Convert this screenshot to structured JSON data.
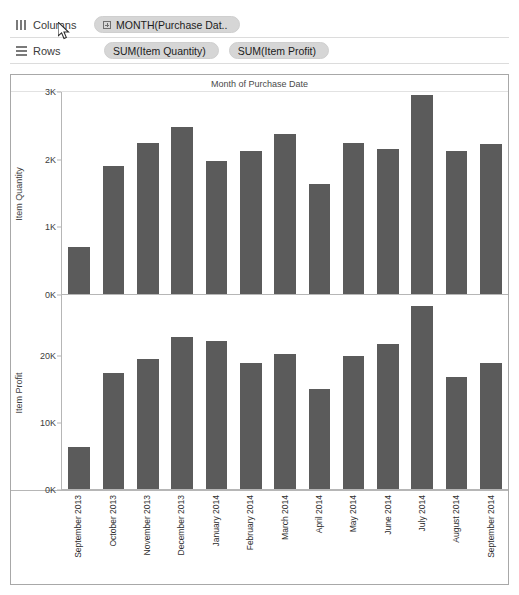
{
  "shelves": {
    "columns": {
      "label": "Columns",
      "icon": "columns-icon",
      "pills": [
        {
          "text": "MONTH(Purchase Dat..",
          "icon": "expand-plus-icon"
        }
      ]
    },
    "rows": {
      "label": "Rows",
      "icon": "rows-icon",
      "pills": [
        {
          "text": "SUM(Item Quantity)"
        },
        {
          "text": "SUM(Item Profit)"
        }
      ]
    }
  },
  "viz": {
    "title": "Month of Purchase Date"
  },
  "colors": {
    "bar": "#5b5b5b",
    "pill": "#d6d6d6",
    "frame_border": "#a8a8a8",
    "axis_line": "#b6b6b6"
  },
  "chart_data": [
    {
      "type": "bar",
      "title": "Month of Purchase Date",
      "xlabel": "",
      "ylabel": "Item Quantity",
      "ylim": [
        0,
        3000
      ],
      "yticks": [
        0,
        1000,
        2000,
        3000
      ],
      "ytick_labels": [
        "0K",
        "1K",
        "2K",
        "3K"
      ],
      "grid": false,
      "legend": "none",
      "categories": [
        "September 2013",
        "October 2013",
        "November 2013",
        "December 2013",
        "January 2014",
        "February 2014",
        "March 2014",
        "April 2014",
        "May 2014",
        "June 2014",
        "July 2014",
        "August 2014",
        "September 2014"
      ],
      "values": [
        700,
        1900,
        2250,
        2480,
        1970,
        2120,
        2370,
        1640,
        2250,
        2150,
        2950,
        2120,
        2230
      ]
    },
    {
      "type": "bar",
      "title": "",
      "xlabel": "",
      "ylabel": "Item Profit",
      "ylim": [
        0,
        29000
      ],
      "yticks": [
        0,
        10000,
        20000
      ],
      "ytick_labels": [
        "0K",
        "10K",
        "20K"
      ],
      "grid": false,
      "legend": "none",
      "categories": [
        "September 2013",
        "October 2013",
        "November 2013",
        "December 2013",
        "January 2014",
        "February 2014",
        "March 2014",
        "April 2014",
        "May 2014",
        "June 2014",
        "July 2014",
        "August 2014",
        "September 2014"
      ],
      "values": [
        6300,
        17400,
        19500,
        22700,
        22100,
        18900,
        20200,
        15000,
        19900,
        21700,
        27300,
        16700,
        18900
      ]
    }
  ]
}
